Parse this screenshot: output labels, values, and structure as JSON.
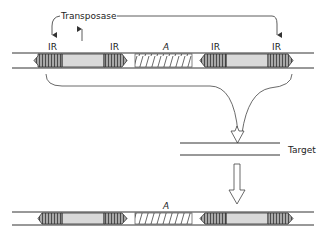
{
  "diagram": {
    "labels": {
      "transposase": "Transposase",
      "ir": "IR",
      "a_gene": "A",
      "target": "Target"
    },
    "top_element": {
      "ir_labels": [
        "IR",
        "IR",
        "IR",
        "IR"
      ],
      "center_gene": "A"
    },
    "bottom_element": {
      "center_gene": "A"
    },
    "colors": {
      "line": "#333333",
      "ir_fill": "#9a9a9a",
      "body_fill": "#d9d9d9",
      "hatch": "#444444",
      "background": "#ffffff"
    }
  }
}
